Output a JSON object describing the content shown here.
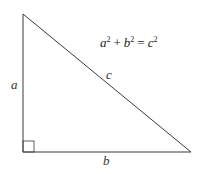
{
  "diagram": {
    "type": "right-triangle",
    "equation": {
      "a": "a",
      "b": "b",
      "c": "c",
      "exp": "2",
      "plus": "+",
      "equals": "="
    },
    "labels": {
      "side_a": "a",
      "side_b": "b",
      "side_c": "c"
    },
    "colors": {
      "stroke": "#3a3a3a",
      "text": "#333333",
      "background": "#ffffff"
    }
  }
}
